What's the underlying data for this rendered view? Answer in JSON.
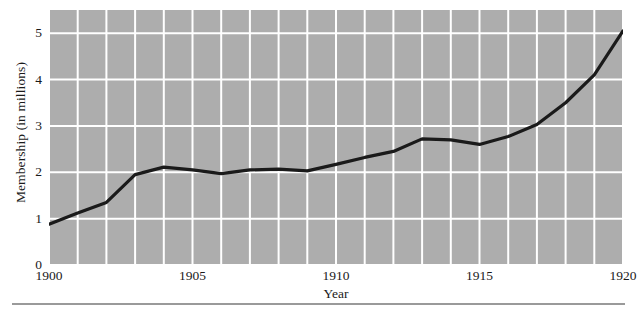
{
  "chart_data": {
    "type": "line",
    "title": "",
    "xlabel": "Year",
    "ylabel": "Membership (in millions)",
    "xlim": [
      1900,
      1920
    ],
    "ylim": [
      0,
      5.5
    ],
    "xticks": [
      1900,
      1905,
      1910,
      1915,
      1920
    ],
    "xtick_labels": [
      "1900",
      "1905",
      "1910",
      "1915",
      "1920"
    ],
    "yticks": [
      0,
      1,
      2,
      3,
      4,
      5
    ],
    "ytick_labels": [
      "0",
      "1",
      "2",
      "3",
      "4",
      "5"
    ],
    "grid": true,
    "grid_color": "#ffffff",
    "plot_background": "#adadad",
    "line_color": "#1a1a1a",
    "legend": null,
    "x": [
      1900,
      1901,
      1902,
      1903,
      1904,
      1905,
      1906,
      1907,
      1908,
      1909,
      1910,
      1911,
      1912,
      1913,
      1914,
      1915,
      1916,
      1917,
      1918,
      1919,
      1920
    ],
    "values": [
      0.88,
      1.12,
      1.35,
      1.95,
      2.11,
      2.05,
      1.97,
      2.05,
      2.07,
      2.03,
      2.17,
      2.32,
      2.45,
      2.72,
      2.7,
      2.6,
      2.77,
      3.03,
      3.5,
      4.1,
      5.05
    ],
    "series": [
      {
        "name": "Membership",
        "values": [
          0.88,
          1.12,
          1.35,
          1.95,
          2.11,
          2.05,
          1.97,
          2.05,
          2.07,
          2.03,
          2.17,
          2.32,
          2.45,
          2.72,
          2.7,
          2.6,
          2.77,
          3.03,
          3.5,
          4.1,
          5.05
        ]
      }
    ]
  }
}
